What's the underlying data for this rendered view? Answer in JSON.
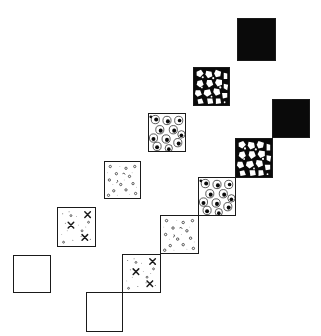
{
  "diagram": {
    "texture_stages": [
      "empty",
      "sparse-stars",
      "small-rings",
      "circles-with-dots",
      "leopard-spots",
      "solid-black"
    ],
    "left_chain": {
      "arrangement": "separated diagonal",
      "squares": [
        {
          "stage": "empty",
          "x": 13,
          "y": 255,
          "w": 38,
          "h": 38
        },
        {
          "stage": "sparse-stars",
          "x": 57,
          "y": 207,
          "w": 39,
          "h": 40
        },
        {
          "stage": "small-rings",
          "x": 104,
          "y": 161,
          "w": 37,
          "h": 38
        },
        {
          "stage": "circles-with-dots",
          "x": 148,
          "y": 113,
          "w": 38,
          "h": 39
        },
        {
          "stage": "leopard-spots",
          "x": 193,
          "y": 67,
          "w": 37,
          "h": 39
        },
        {
          "stage": "solid-black",
          "x": 237,
          "y": 18,
          "w": 39,
          "h": 43
        }
      ]
    },
    "right_chain": {
      "arrangement": "corner-touching diagonal",
      "squares": [
        {
          "stage": "empty",
          "x": 86,
          "y": 292,
          "w": 37,
          "h": 40
        },
        {
          "stage": "sparse-stars",
          "x": 123,
          "y": 254,
          "w": 38,
          "h": 38
        },
        {
          "stage": "small-rings",
          "x": 161,
          "y": 216,
          "w": 38,
          "h": 38
        },
        {
          "stage": "circles-with-dots",
          "x": 199,
          "y": 177,
          "w": 37,
          "h": 39
        },
        {
          "stage": "leopard-spots",
          "x": 236,
          "y": 138,
          "w": 36,
          "h": 39
        },
        {
          "stage": "solid-black",
          "x": 272,
          "y": 99,
          "w": 38,
          "h": 39
        }
      ]
    },
    "colors": {
      "ink": "#0a0a0a",
      "paper": "#ffffff"
    }
  }
}
